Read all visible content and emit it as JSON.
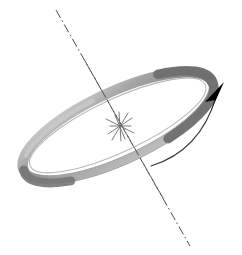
{
  "figure": {
    "background_color": "#ffffff",
    "width": 242,
    "height": 255,
    "elements": {
      "ring": {
        "name": "torus-ring",
        "description": "Grey annulus (ring) drawn in oblique perspective, major axis from lower-left to upper-right",
        "center": [
          118,
          126
        ],
        "major_radius": 104,
        "minor_radius": 34,
        "tilt_deg": -25,
        "tube_thickness": 9,
        "color_light": "#d2d2d2",
        "color_mid": "#9a9a9a",
        "color_dark": "#6e6e6e",
        "outline_color": "#7d7d7d"
      },
      "axis": {
        "name": "rotation-axis",
        "description": "Dash-dot centre line passing through the ring centre",
        "start": [
          56,
          10
        ],
        "end": [
          190,
          246
        ],
        "style": "dash-dot",
        "color": "#4a4a4a",
        "width": 1
      },
      "center_mark": {
        "name": "center-star-mark",
        "description": "Small six-ray star marking the ring centre",
        "position": [
          120,
          126
        ],
        "ray_count": 6,
        "radius": 14,
        "color": "#6a6a6a"
      },
      "rotation_arrow": {
        "name": "rotation-direction-arrow",
        "description": "Thin curved arrow sweeping upward to the right showing sense of rotation",
        "tail": [
          151,
          166
        ],
        "tip": [
          224,
          84
        ],
        "curve_control": [
          200,
          150
        ],
        "line_color": "#3a3a3a",
        "head_color": "#000000",
        "head_length": 26,
        "head_width": 11
      }
    }
  }
}
